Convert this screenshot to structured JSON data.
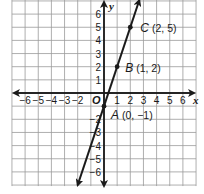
{
  "chart_data": {
    "type": "line",
    "title": "",
    "xlabel": "x",
    "ylabel": "y",
    "origin_label": "O",
    "xlim": [
      -7,
      7
    ],
    "ylim": [
      -7,
      7
    ],
    "grid": true,
    "x_ticks": [
      "−6",
      "−5",
      "−4",
      "−3",
      "−2",
      "1",
      "2",
      "3",
      "4",
      "5",
      "6"
    ],
    "y_ticks": [
      "6",
      "5",
      "4",
      "3",
      "2",
      "1",
      "−2",
      "−3",
      "−4",
      "−5",
      "−6"
    ],
    "series": [
      {
        "name": "y = 3x − 1",
        "x": [
          0,
          1,
          2
        ],
        "y": [
          -1,
          2,
          5
        ],
        "arrows": "both"
      }
    ],
    "points": [
      {
        "name": "A",
        "coords": "(0, −1)",
        "x": 0,
        "y": -1
      },
      {
        "name": "B",
        "coords": "(1, 2)",
        "x": 1,
        "y": 2
      },
      {
        "name": "C",
        "coords": "(2, 5)",
        "x": 2,
        "y": 5
      }
    ]
  }
}
